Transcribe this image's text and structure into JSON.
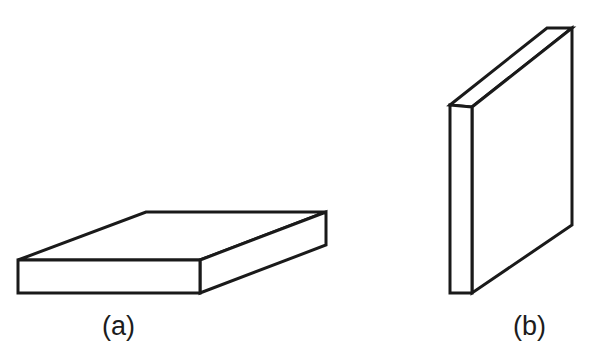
{
  "figure": {
    "background_color": "#ffffff",
    "line_color": "#1a1a1a",
    "fill_color": "#ffffff",
    "line_width": 3,
    "width": 597,
    "height": 356,
    "shapes": [
      {
        "id": "slab-horizontal",
        "caption": "(a)",
        "orientation": "flat / horizontal",
        "faces": {
          "front": "18,260 200,260 200,293 18,293",
          "top": "18,260 146,212 326,212 200,260",
          "right": "200,260 326,212 326,245 200,293"
        }
      },
      {
        "id": "slab-vertical",
        "caption": "(b)",
        "orientation": "upright / vertical",
        "faces": {
          "left": "450,105 472,107 472,293 450,293",
          "top": "450,105 547,28 572,28 472,107",
          "front": "472,107 572,28 572,225 472,293"
        }
      }
    ]
  },
  "captions": {
    "a": "(a)",
    "b": "(b)"
  }
}
